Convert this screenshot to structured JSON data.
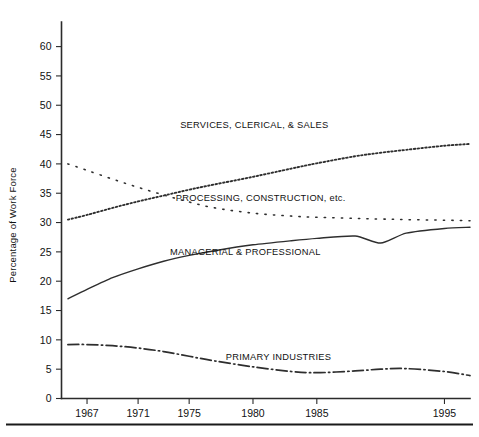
{
  "chart_data": {
    "type": "line",
    "title": "",
    "subtitle": "",
    "xlabel": "",
    "ylabel": "Percentage of Work Force",
    "xlim": [
      1965,
      1997
    ],
    "ylim": [
      0,
      63
    ],
    "grid": false,
    "legend_position": "inline-annotations",
    "y_ticks": [
      0,
      5,
      10,
      15,
      20,
      25,
      30,
      35,
      40,
      45,
      50,
      55,
      60
    ],
    "y_tick_labels": [
      "0",
      "5",
      "10",
      "15",
      "20",
      "25",
      "30",
      "35",
      "40",
      "45",
      "50",
      "55",
      "60"
    ],
    "x_ticks": [
      1967,
      1971,
      1975,
      1980,
      1985,
      1995
    ],
    "x_tick_labels": [
      "1967",
      "1971",
      "1975",
      "1980",
      "1985",
      "1995"
    ],
    "x": [
      1965.5,
      1967,
      1969,
      1971,
      1973,
      1975,
      1977,
      1980,
      1983,
      1985,
      1988,
      1990,
      1992,
      1995,
      1997
    ],
    "series": [
      {
        "name": "SERVICES, CLERICAL, & SALES",
        "label": "SERVICES, CLERICAL, & SALES",
        "style": "dotted-dense",
        "color": "#2e2e2e",
        "values": [
          30.5,
          31.3,
          32.5,
          33.6,
          34.6,
          35.6,
          36.5,
          37.8,
          39.2,
          40.1,
          41.3,
          41.9,
          42.4,
          43.1,
          43.4
        ],
        "label_x": 1980.1,
        "label_y": 46.2
      },
      {
        "name": "PROCESSING, CONSTRUCTION, etc.",
        "label": "PROCESSING, CONSTRUCTION, etc.",
        "style": "dotted-sparse",
        "color": "#3a3a3a",
        "values": [
          40.0,
          38.9,
          37.4,
          36.0,
          34.7,
          33.5,
          32.5,
          31.6,
          31.1,
          30.9,
          30.7,
          30.6,
          30.5,
          30.4,
          30.3
        ],
        "label_x": 1980.6,
        "label_y": 33.6
      },
      {
        "name": "MANAGERIAL & PROFESSIONAL",
        "label": "MANAGERIAL & PROFESSIONAL",
        "style": "solid",
        "color": "#2e2e2e",
        "values": [
          17.0,
          18.6,
          20.6,
          22.1,
          23.4,
          24.4,
          25.2,
          26.2,
          26.9,
          27.3,
          27.7,
          26.5,
          28.2,
          29.0,
          29.2
        ],
        "label_x": 1979.4,
        "label_y": 24.4
      },
      {
        "name": "PRIMARY INDUSTRIES",
        "label": "PRIMARY INDUSTRIES",
        "style": "dash-dot",
        "color": "#3a3a3a",
        "values": [
          9.2,
          9.2,
          9.0,
          8.6,
          8.0,
          7.2,
          6.4,
          5.4,
          4.6,
          4.4,
          4.7,
          5.0,
          5.1,
          4.6,
          3.9
        ],
        "label_x": 1982.0,
        "label_y": 6.6
      }
    ]
  },
  "axis": {
    "y_axis_label": "Percentage of Work Force"
  }
}
